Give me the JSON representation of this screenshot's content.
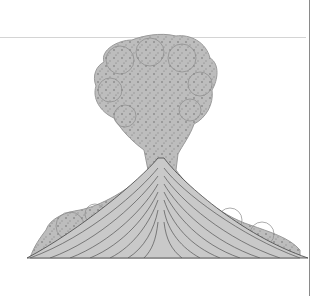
{
  "diagram": {
    "labels": {
      "cloud": [
        "Buoyant",
        "cloud of hot",
        "ash and",
        "gas"
      ],
      "flowing_mass": [
        "Flowing mass",
        "of hot ash",
        "and gas"
      ],
      "ash_flow": "Ash flow"
    },
    "colors": {
      "cloud_fill": "#b9b9b9",
      "cloud_texture": "#8e8e8e",
      "cone_fill": "#c4c4c4",
      "cone_lines": "#555555",
      "base_fill": "#a9a9a9",
      "outline": "#333333",
      "arrow": "#111111"
    }
  }
}
